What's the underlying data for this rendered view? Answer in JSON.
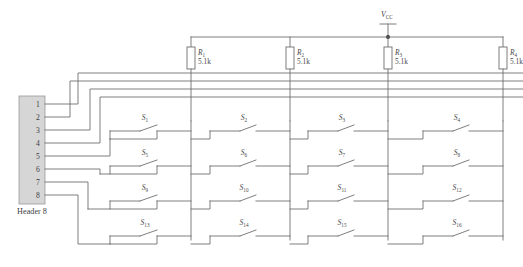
{
  "diagram": {
    "supply": {
      "label_main": "V",
      "label_sub": "CC",
      "symbol": "terminal-bar"
    },
    "header": {
      "caption": "Header 8",
      "pins": [
        "1",
        "2",
        "3",
        "4",
        "5",
        "6",
        "7",
        "8"
      ]
    },
    "resistors": [
      {
        "ref": "R",
        "index": "1",
        "value": "5.1k"
      },
      {
        "ref": "R",
        "index": "2",
        "value": "5.1k"
      },
      {
        "ref": "R",
        "index": "3",
        "value": "5.1k"
      },
      {
        "ref": "R",
        "index": "4",
        "value": "5.1k"
      }
    ],
    "switch_rows": [
      {
        "row": 1,
        "switches": [
          {
            "ref": "S",
            "index": "1"
          },
          {
            "ref": "S",
            "index": "2"
          },
          {
            "ref": "S",
            "index": "3"
          },
          {
            "ref": "S",
            "index": "4"
          }
        ]
      },
      {
        "row": 2,
        "switches": [
          {
            "ref": "S",
            "index": "5"
          },
          {
            "ref": "S",
            "index": "6"
          },
          {
            "ref": "S",
            "index": "7"
          },
          {
            "ref": "S",
            "index": "8"
          }
        ]
      },
      {
        "row": 3,
        "switches": [
          {
            "ref": "S",
            "index": "9"
          },
          {
            "ref": "S",
            "index": "10"
          },
          {
            "ref": "S",
            "index": "11"
          },
          {
            "ref": "S",
            "index": "12"
          }
        ]
      },
      {
        "row": 4,
        "switches": [
          {
            "ref": "S",
            "index": "13"
          },
          {
            "ref": "S",
            "index": "14"
          },
          {
            "ref": "S",
            "index": "15"
          },
          {
            "ref": "S",
            "index": "16"
          }
        ]
      }
    ],
    "colors": {
      "wire": "#6f6f72",
      "header_fill": "#d6d6d6",
      "text": "#4a4a4d",
      "junction": "#2c2c2e",
      "background": "#ffffff"
    }
  }
}
